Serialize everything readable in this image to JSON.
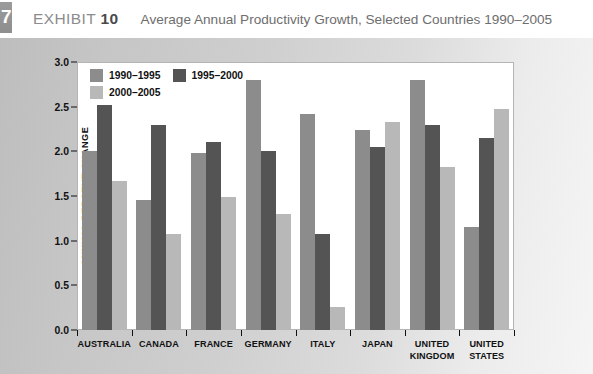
{
  "header": {
    "chapter_tab": "7",
    "exhibit_label": "EXHIBIT",
    "exhibit_number": "10",
    "title": "Average Annual Productivity Growth, Selected Countries 1990–2005"
  },
  "colors": {
    "series_1990_1995": "#8c8c8c",
    "series_1995_2000": "#545454",
    "series_2000_2005": "#b8b8b8",
    "plot_background": "#ffffff",
    "page_background": "#cfcfcf",
    "header_background": "#ffffff",
    "axis": "#111111"
  },
  "chart_data": {
    "type": "bar",
    "title": "Average Annual Productivity Growth, Selected Countries 1990–2005",
    "xlabel": "",
    "ylabel": "ANNUAL PERCENT CHANGE",
    "ylim": [
      0.0,
      3.0
    ],
    "yticks": [
      "0.0",
      "0.5",
      "1.0",
      "1.5",
      "2.0",
      "2.5",
      "3.0"
    ],
    "ytick_values": [
      0.0,
      0.5,
      1.0,
      1.5,
      2.0,
      2.5,
      3.0
    ],
    "grid": false,
    "legend_position": "top-left inside plot",
    "categories": [
      "AUSTRALIA",
      "CANADA",
      "FRANCE",
      "GERMANY",
      "ITALY",
      "JAPAN",
      "UNITED KINGDOM",
      "UNITED STATES"
    ],
    "series": [
      {
        "name": "1990–1995",
        "color": "#8c8c8c",
        "values": [
          2.0,
          1.45,
          1.98,
          2.8,
          2.42,
          2.24,
          2.8,
          1.15
        ]
      },
      {
        "name": "1995–2000",
        "color": "#545454",
        "values": [
          2.52,
          2.3,
          2.1,
          2.0,
          1.08,
          2.05,
          2.3,
          2.15
        ]
      },
      {
        "name": "2000–2005",
        "color": "#b8b8b8",
        "values": [
          1.67,
          1.07,
          1.49,
          1.3,
          0.26,
          2.33,
          1.83,
          2.47
        ]
      }
    ]
  }
}
